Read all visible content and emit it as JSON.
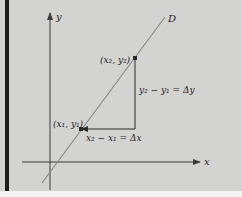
{
  "diagram": {
    "type": "slope-of-line",
    "axes": {
      "x_label": "x",
      "y_label": "y"
    },
    "line_label": "D",
    "points": [
      {
        "name": "P1",
        "label": "(x₁, y₁)"
      },
      {
        "name": "P2",
        "label": "(x₂, y₂)"
      }
    ],
    "run_label": "x₂ − x₁ = Δx",
    "rise_label": "y₂ − y₁ = Δy",
    "colors": {
      "background": "#d3d3d1",
      "line_D": "#8a8a88",
      "axes": "#3a3a3a",
      "border": "#1c1c1c"
    }
  }
}
